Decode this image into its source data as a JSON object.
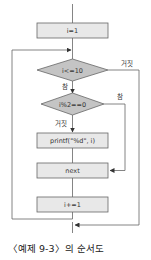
{
  "flowchart": {
    "nodes": {
      "init": {
        "type": "process",
        "text": "i=1"
      },
      "cond_loop": {
        "type": "decision",
        "text": "i<=10"
      },
      "cond_even": {
        "type": "decision",
        "text": "i%2==0"
      },
      "print": {
        "type": "process",
        "text": "printf(\"%d\", i)"
      },
      "next": {
        "type": "process",
        "text": "next"
      },
      "incr": {
        "type": "process",
        "text": "i+=1"
      }
    },
    "edge_labels": {
      "loop_false": "거짓",
      "loop_true": "참",
      "even_true": "참",
      "even_false": "거짓"
    },
    "colors": {
      "process_fill": "#e8e8e8",
      "decision_fill": "#c4c4c4",
      "stroke": "#666666"
    }
  },
  "caption": "〈예제 9-3〉의 순서도"
}
